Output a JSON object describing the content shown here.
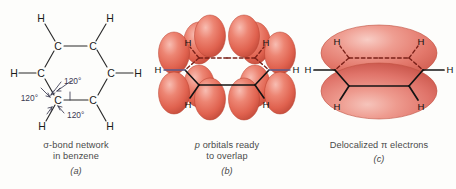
{
  "figure": {
    "background_color": "#fdfdfb"
  },
  "colors": {
    "atom_label": "#1a1a1a",
    "bond_line": "#2b2b2b",
    "angle_label": "#3a3a52",
    "orbital_red": "#e8705f",
    "orbital_red_dark": "#c9503f",
    "orbital_red_light": "#f6b5aa",
    "cloud_red": "#e9837a",
    "cloud_red_dark": "#cf5c4f",
    "cloud_highlight": "#f7c3bb",
    "hydrogen_bond_blue": "#5a5a8a",
    "back_bond_dashed": "#7a2018",
    "caption_text": "#4a4a4a"
  },
  "panels": [
    {
      "id": "a",
      "letter": "(a)",
      "caption_lines": [
        "σ-bond network",
        "in benzene"
      ],
      "atoms": {
        "carbon_label": "C",
        "hydrogen_label": "H",
        "carbon_count": 6,
        "hydrogen_count": 6
      },
      "angles": [
        {
          "label": "120°",
          "position": "upper-right"
        },
        {
          "label": "120°",
          "position": "left"
        },
        {
          "label": "120°",
          "position": "lower-right"
        }
      ],
      "angle_value": "120°",
      "angle_count": 3
    },
    {
      "id": "b",
      "letter": "(b)",
      "caption_lines": [
        "p orbitals ready",
        "to overlap"
      ],
      "caption_italic_first_word": "p",
      "atoms": {
        "hydrogen_label": "H",
        "hydrogen_count": 6
      },
      "orbitals": {
        "type": "p",
        "count": 6,
        "lobes_per_orbital": 2,
        "total_lobes": 12,
        "orientation": "perpendicular to ring plane"
      }
    },
    {
      "id": "c",
      "letter": "(c)",
      "caption_lines": [
        "Delocalized π electrons"
      ],
      "atoms": {
        "hydrogen_label": "H",
        "hydrogen_count": 6
      },
      "cloud": {
        "shape": "torus",
        "count": 2,
        "position": "above and below ring plane"
      }
    }
  ],
  "labels": {
    "H": "H",
    "C": "C",
    "angle": "120°"
  }
}
